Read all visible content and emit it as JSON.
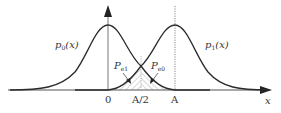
{
  "diagram": {
    "title": "",
    "curves": [
      {
        "name": "p0",
        "label_main": "p",
        "label_sub": "0",
        "label_arg": "(x)",
        "mean": 0
      },
      {
        "name": "p1",
        "label_main": "p",
        "label_sub": "1",
        "label_arg": "(x)",
        "mean": "A"
      }
    ],
    "error_regions": [
      {
        "name": "Pe1",
        "label_main": "P",
        "label_sub": "e1"
      },
      {
        "name": "Pe0",
        "label_main": "P",
        "label_sub": "e0"
      }
    ],
    "axis": {
      "x_label": "x",
      "ticks": [
        "0",
        "A/2",
        "A"
      ]
    },
    "colors": {
      "curve": "#2a2a2a",
      "axis": "#555555",
      "hatch": "#9a9a9a",
      "text": "#333333"
    }
  }
}
